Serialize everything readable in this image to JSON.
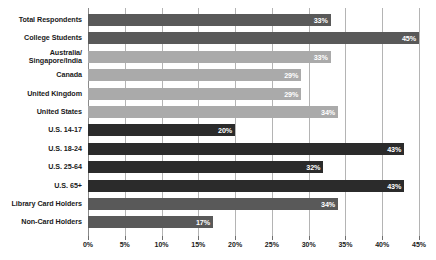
{
  "chart_data": {
    "type": "bar",
    "orientation": "horizontal",
    "title": "",
    "subtitle": "",
    "xlabel": "",
    "ylabel": "",
    "xlim": [
      0,
      45
    ],
    "xtick_step": 5,
    "grid": true,
    "legend": "none",
    "categories": [
      "Total Respondents",
      "College Students",
      "Australia/\nSingapore/India",
      "Canada",
      "United Kingdom",
      "United States",
      "U.S. 14-17",
      "U.S. 18-24",
      "U.S. 25-64",
      "U.S. 65+",
      "Library Card Holders",
      "Non-Card Holders"
    ],
    "values": [
      33,
      45,
      33,
      29,
      29,
      34,
      20,
      43,
      32,
      43,
      34,
      17
    ],
    "value_labels": [
      "33%",
      "45%",
      "33%",
      "29%",
      "29%",
      "34%",
      "20%",
      "43%",
      "32%",
      "43%",
      "34%",
      "17%"
    ],
    "bar_colors": [
      "#595959",
      "#595959",
      "#aaaaaa",
      "#aaaaaa",
      "#aaaaaa",
      "#aaaaaa",
      "#2b2b2b",
      "#2b2b2b",
      "#2b2b2b",
      "#2b2b2b",
      "#595959",
      "#595959"
    ],
    "xticks": [
      0,
      5,
      10,
      15,
      20,
      25,
      30,
      35,
      40,
      45
    ],
    "xtick_labels": [
      "0%",
      "5%",
      "10%",
      "15%",
      "20%",
      "25%",
      "30%",
      "35%",
      "40%",
      "45%"
    ],
    "colors": {
      "background": "#ffffff",
      "gridline": "#b4b4b4",
      "axis": "#8a8a8a",
      "label_text": "#1a1a1a",
      "value_text": "#ffffff",
      "group_dark": "#2b2b2b",
      "group_medium": "#595959",
      "group_light": "#aaaaaa"
    }
  }
}
